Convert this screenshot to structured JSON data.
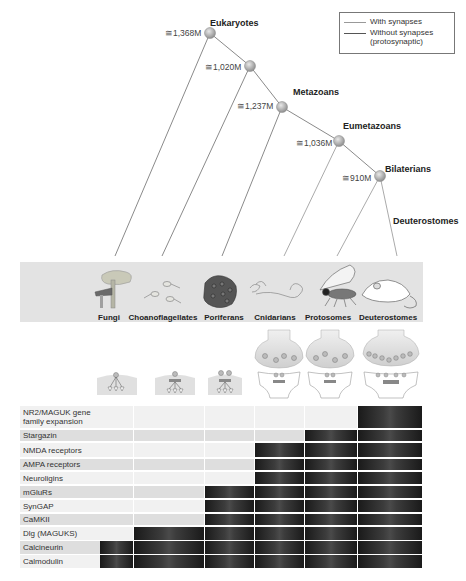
{
  "legend": {
    "with_synapses": "With synapses",
    "without_synapses_line1": "Without synapses",
    "without_synapses_line2": "(protosynaptic)",
    "colors": {
      "with_synapses": "#999999",
      "without_synapses": "#555555"
    }
  },
  "tree": {
    "nodes": [
      {
        "name": "Eukaryotes",
        "age": "≅1,368M"
      },
      {
        "name": "",
        "age": "≅1,020M"
      },
      {
        "name": "Metazoans",
        "age": "≅1,237M"
      },
      {
        "name": "Eumetazoans",
        "age": "≅1,036M"
      },
      {
        "name": "Bilaterians",
        "age": "≅910M"
      }
    ],
    "branch_label": "Deuterostomes"
  },
  "taxa": [
    "Fungi",
    "Choanoflagellates",
    "Poriferans",
    "Cnidarians",
    "Protosomes",
    "Deuterostomes"
  ],
  "table": {
    "columns": [
      "Fungi",
      "Choanoflagellates",
      "Poriferans",
      "Cnidarians",
      "Protosomes",
      "Deuterostomes"
    ],
    "rows": [
      {
        "label": "NR2/MAGUK gene family expansion",
        "present_from": 5
      },
      {
        "label": "Stargazin",
        "present_from": 4
      },
      {
        "label": "NMDA receptors",
        "present_from": 3
      },
      {
        "label": "AMPA receptors",
        "present_from": 3
      },
      {
        "label": "Neuroligins",
        "present_from": 3
      },
      {
        "label": "mGluRs",
        "present_from": 2
      },
      {
        "label": "SynGAP",
        "present_from": 2
      },
      {
        "label": "CaMKII",
        "present_from": 2
      },
      {
        "label": "Dlg (MAGUKS)",
        "present_from": 1
      },
      {
        "label": "Calcineurin",
        "present_from": 0
      },
      {
        "label": "Calmodulin",
        "present_from": 0
      }
    ]
  },
  "chart_data": {
    "type": "table",
    "columns": [
      "Fungi",
      "Choanoflagellates",
      "Poriferans",
      "Cnidarians",
      "Protosomes",
      "Deuterostomes"
    ],
    "rows": [
      {
        "protein": "NR2/MAGUK gene family expansion",
        "present": [
          0,
          0,
          0,
          0,
          0,
          1
        ]
      },
      {
        "protein": "Stargazin",
        "present": [
          0,
          0,
          0,
          0,
          1,
          1
        ]
      },
      {
        "protein": "NMDA receptors",
        "present": [
          0,
          0,
          0,
          1,
          1,
          1
        ]
      },
      {
        "protein": "AMPA receptors",
        "present": [
          0,
          0,
          0,
          1,
          1,
          1
        ]
      },
      {
        "protein": "Neuroligins",
        "present": [
          0,
          0,
          0,
          1,
          1,
          1
        ]
      },
      {
        "protein": "mGluRs",
        "present": [
          0,
          0,
          1,
          1,
          1,
          1
        ]
      },
      {
        "protein": "SynGAP",
        "present": [
          0,
          0,
          1,
          1,
          1,
          1
        ]
      },
      {
        "protein": "CaMKII",
        "present": [
          0,
          0,
          1,
          1,
          1,
          1
        ]
      },
      {
        "protein": "Dlg (MAGUKS)",
        "present": [
          0,
          1,
          1,
          1,
          1,
          1
        ]
      },
      {
        "protein": "Calcineurin",
        "present": [
          1,
          1,
          1,
          1,
          1,
          1
        ]
      },
      {
        "protein": "Calmodulin",
        "present": [
          1,
          1,
          1,
          1,
          1,
          1
        ]
      }
    ],
    "divergence_times": {
      "Eukaryotes": "≅1,368M",
      "Unnamed (Choanoflagellates+Metazoa)": "≅1,020M",
      "Metazoans": "≅1,237M",
      "Eumetazoans": "≅1,036M",
      "Bilaterians": "≅910M"
    }
  }
}
